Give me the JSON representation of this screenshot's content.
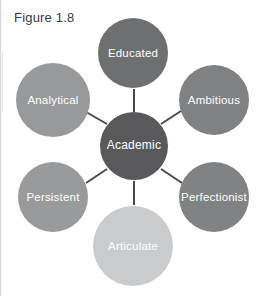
{
  "figure": {
    "caption": "Figure 1.8",
    "background_color": "#ffffff"
  },
  "diagram": {
    "type": "hub-and-spoke",
    "connector_color": "#4a4a4c",
    "center": {
      "label": "Academic",
      "color": "#59595b",
      "text_color": "#ffffff",
      "cx": 134,
      "cy": 146,
      "r": 34
    },
    "satellites": [
      {
        "label": "Educated",
        "color": "#6e6f71",
        "text_color": "#ffffff",
        "cx": 133,
        "cy": 53,
        "r": 35,
        "position": "top"
      },
      {
        "label": "Ambitious",
        "color": "#808183",
        "text_color": "#ffffff",
        "cx": 214,
        "cy": 100,
        "r": 35,
        "position": "top-right"
      },
      {
        "label": "Perfectionist",
        "color": "#818284",
        "text_color": "#ffffff",
        "cx": 214,
        "cy": 197,
        "r": 35,
        "position": "bottom-right"
      },
      {
        "label": "Articulate",
        "color": "#c9cbcd",
        "text_color": "#ffffff",
        "cx": 133,
        "cy": 246,
        "r": 40,
        "position": "bottom"
      },
      {
        "label": "Persistent",
        "color": "#989a9c",
        "text_color": "#ffffff",
        "cx": 53,
        "cy": 197,
        "r": 35,
        "position": "bottom-left"
      },
      {
        "label": "Analytical",
        "color": "#97999b",
        "text_color": "#ffffff",
        "cx": 53,
        "cy": 100,
        "r": 37,
        "position": "top-left"
      }
    ],
    "connectors": [
      {
        "from": "Academic",
        "to": "Educated",
        "x1": 134,
        "y1": 112,
        "x2": 134,
        "y2": 89
      },
      {
        "from": "Academic",
        "to": "Ambitious",
        "x1": 161,
        "y1": 124,
        "x2": 181,
        "y2": 111
      },
      {
        "from": "Academic",
        "to": "Perfectionist",
        "x1": 161,
        "y1": 169,
        "x2": 182,
        "y2": 183
      },
      {
        "from": "Academic",
        "to": "Articulate",
        "x1": 134,
        "y1": 181,
        "x2": 134,
        "y2": 205
      },
      {
        "from": "Academic",
        "to": "Persistent",
        "x1": 107,
        "y1": 169,
        "x2": 86,
        "y2": 183
      },
      {
        "from": "Academic",
        "to": "Analytical",
        "x1": 107,
        "y1": 124,
        "x2": 86,
        "y2": 112
      }
    ]
  }
}
